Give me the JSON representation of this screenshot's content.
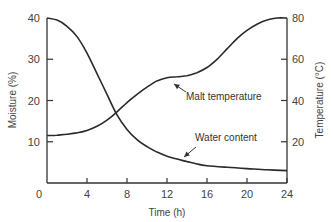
{
  "chart_data": {
    "type": "line",
    "title": "",
    "xlabel": "Time (h)",
    "ylabel": "Moisture (%)",
    "y2label": "Temperature (°C)",
    "xlim": [
      0,
      24
    ],
    "ylim": [
      0,
      40
    ],
    "y2lim": [
      0,
      80
    ],
    "xticks": [
      0,
      4,
      8,
      12,
      16,
      20,
      24
    ],
    "yticks": [
      0,
      10,
      20,
      30,
      40
    ],
    "y2ticks": [
      20,
      40,
      60,
      80
    ],
    "grid": false,
    "legend": "none (inline annotations with arrows)",
    "series": [
      {
        "name": "Water content",
        "axis": "left",
        "x": [
          0,
          1,
          2,
          3,
          4,
          5,
          6,
          7,
          8,
          9,
          10,
          11,
          12,
          13,
          14,
          15,
          16,
          18,
          20,
          22,
          24
        ],
        "values": [
          40,
          39.5,
          38,
          35.5,
          31.5,
          26.5,
          21.5,
          16.5,
          13,
          10.5,
          8.8,
          7.5,
          6.5,
          5.8,
          5.2,
          4.6,
          4.2,
          3.8,
          3.5,
          3.2,
          3
        ]
      },
      {
        "name": "Malt temperature",
        "axis": "right",
        "x": [
          0,
          1,
          2,
          3,
          4,
          5,
          6,
          7,
          8,
          9,
          10,
          11,
          12,
          13,
          14,
          15,
          16,
          17,
          18,
          19,
          20,
          21,
          22,
          23,
          24
        ],
        "values": [
          23,
          23.2,
          23.6,
          24.3,
          25.5,
          27.5,
          30.5,
          34.5,
          39,
          43,
          46.5,
          49.5,
          51,
          51.5,
          52,
          53.5,
          56,
          60,
          65,
          70,
          74,
          77,
          79,
          80,
          80
        ]
      }
    ],
    "annotations": [
      {
        "text": "Malt temperature",
        "arrow_to": {
          "x": 14,
          "y2": 52
        }
      },
      {
        "text": "Water content",
        "arrow_to": {
          "x": 13.5,
          "y": 6
        }
      }
    ]
  },
  "labels": {
    "xlabel": "Time (h)",
    "ylabel": "Moisture (%)",
    "y2label": "Temperature (°C)",
    "malt": "Malt temperature",
    "water": "Water content"
  },
  "ticks": {
    "x": [
      "0",
      "4",
      "8",
      "12",
      "16",
      "20",
      "24"
    ],
    "y": [
      "10",
      "20",
      "30",
      "40"
    ],
    "y2": [
      "20",
      "40",
      "60",
      "80"
    ]
  }
}
